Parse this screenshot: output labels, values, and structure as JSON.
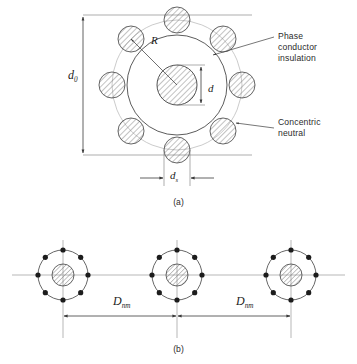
{
  "figure": {
    "panel_a": {
      "caption": "(a)",
      "labels": {
        "outer_diameter": "d",
        "outer_diameter_sub": "0",
        "neutral_radius": "R",
        "conductor_diameter": "d",
        "strand_diameter": "d",
        "strand_diameter_sub": "s"
      },
      "callouts": [
        {
          "name": "phase-conductor-insulation",
          "text": "Phase\nconductor\ninsulation"
        },
        {
          "name": "concentric-neutral",
          "text": "Concentric\nneutral"
        }
      ],
      "geometry": {
        "center_x": 177,
        "center_y": 85,
        "insulation_radius": 50,
        "conductor_radius": 20,
        "neutral_circle_radius": 65,
        "strand_radius": 13,
        "strand_count": 8
      }
    },
    "panel_b": {
      "caption": "(b)",
      "spacing_labels": [
        {
          "name": "spacing-left",
          "symbol": "D",
          "sub": "nm"
        },
        {
          "name": "spacing-right",
          "symbol": "D",
          "sub": "nm"
        }
      ],
      "geometry": {
        "cable_centers_x": [
          63,
          177,
          291
        ],
        "center_y": 275,
        "neutral_circle_radius": 25,
        "conductor_radius": 11,
        "dot_radius": 2.6,
        "dot_count": 8
      }
    }
  },
  "colors": {
    "line": "#3a3a3a",
    "light_line": "#9a9a9a",
    "hatch": "#6e6e6e",
    "text": "#2b2b2b",
    "background": "#ffffff"
  }
}
